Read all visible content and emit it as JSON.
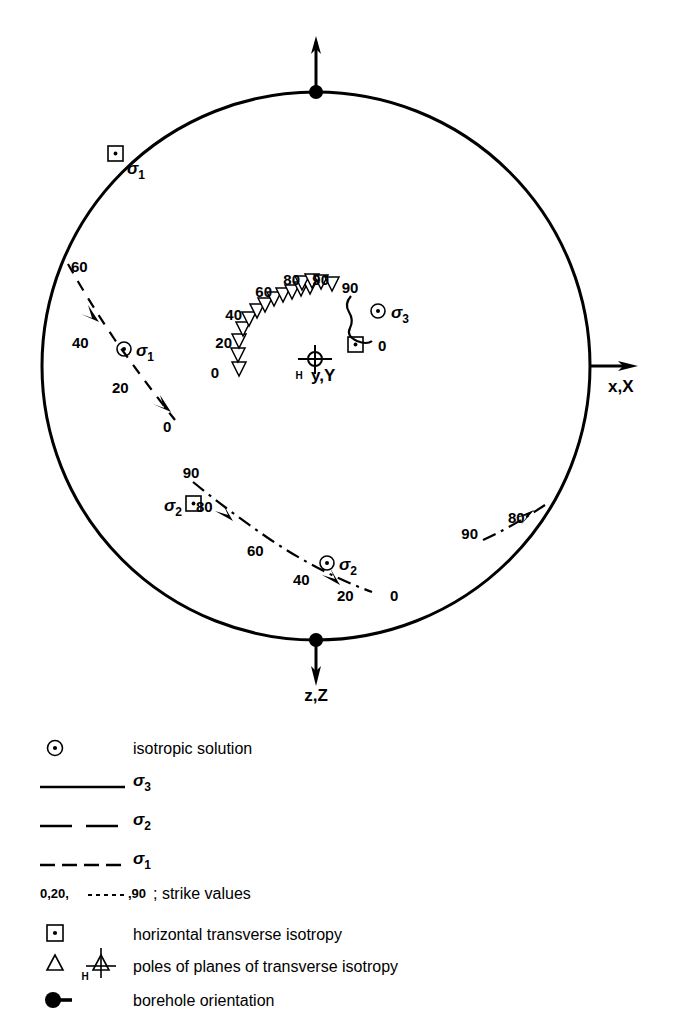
{
  "figure": {
    "type": "stereographic-projection",
    "background": "#ffffff",
    "ink_color": "#000000"
  },
  "axes": {
    "x_label": "x,X",
    "z_label": "z,Z",
    "y_label": "y,Y",
    "y_subscript": "H"
  },
  "stereonet": {
    "center_x": 316,
    "center_y": 366,
    "radius": 274
  },
  "curves": {
    "sigma3": {
      "name": "sigma-3-curve",
      "style": "solid",
      "start_label": "90",
      "end_label": "0"
    },
    "sigma2_main": {
      "name": "sigma-2-curve",
      "style": "dash-dot",
      "labels": [
        "90",
        "80",
        "60",
        "40",
        "20",
        "0"
      ]
    },
    "sigma2_right": {
      "name": "sigma-2-curve-right",
      "style": "dash-dot",
      "labels": [
        "90",
        "80"
      ]
    },
    "sigma1": {
      "name": "sigma-1-curve",
      "style": "dashed",
      "labels": [
        "60",
        "40",
        "20",
        "0"
      ]
    },
    "poles_chain": {
      "name": "poles-of-planes-chain",
      "labels": [
        "0",
        "20",
        "40",
        "60",
        "80",
        "90"
      ],
      "marker": "triangle",
      "count": 16
    }
  },
  "markers": {
    "sigma1_square_label": "σ",
    "sigma1_square_sub": "1",
    "sigma1_circle_label": "σ",
    "sigma1_circle_sub": "1",
    "sigma2_square_label": "σ",
    "sigma2_square_sub": "2",
    "sigma2_circle_label": "σ",
    "sigma2_circle_sub": "2",
    "sigma3_circle_label": "σ",
    "sigma3_circle_sub": "3"
  },
  "strike_labels": {
    "sigma1": [
      "60",
      "40",
      "20",
      "0"
    ],
    "sigma2": [
      "90",
      "80",
      "60",
      "40",
      "20",
      "0"
    ],
    "sigma2_right": [
      "90",
      "80"
    ],
    "sigma3": [
      "90",
      "0"
    ],
    "poles": [
      "0",
      "20",
      "40",
      "60",
      "80",
      "90"
    ]
  },
  "legend": {
    "rows": [
      {
        "id": "isotropic-solution",
        "symbol": "circle-dot",
        "label": "isotropic solution"
      },
      {
        "id": "sigma-3-line",
        "symbol": "solid-line",
        "label": "σ",
        "subscript": "3"
      },
      {
        "id": "sigma-2-line",
        "symbol": "long-dash-line",
        "label": "σ",
        "subscript": "2"
      },
      {
        "id": "sigma-1-line",
        "symbol": "short-dash-line",
        "label": "σ",
        "subscript": "1"
      },
      {
        "id": "strike-values",
        "symbol": "none",
        "prefix": "0,20,",
        "mid": ",90",
        "label": "; strike values"
      },
      {
        "id": "horizontal-transverse-isotropy",
        "symbol": "square-dot",
        "label": "horizontal transverse isotropy"
      },
      {
        "id": "poles-of-planes",
        "symbol": "triangle-and-crosshair",
        "label": "poles of planes of transverse isotropy",
        "crosshair_sub": "H"
      },
      {
        "id": "borehole-orientation",
        "symbol": "filled-dot-tail",
        "label": "borehole orientation"
      }
    ]
  }
}
